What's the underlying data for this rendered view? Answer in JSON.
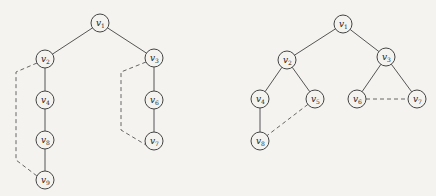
{
  "style": {
    "background": "#f4f3f0",
    "edge_color": "#555555",
    "node_radius": 9
  },
  "graphs": [
    {
      "name": "left-tree",
      "nodes": [
        {
          "id": "v1",
          "label": "v",
          "sub": "1",
          "x": 100,
          "y": 23
        },
        {
          "id": "v2",
          "label": "v",
          "sub": "2",
          "x": 45,
          "y": 59
        },
        {
          "id": "v3",
          "label": "v",
          "sub": "3",
          "x": 154,
          "y": 58
        },
        {
          "id": "v4",
          "label": "v",
          "sub": "4",
          "x": 45,
          "y": 100
        },
        {
          "id": "v6",
          "label": "v",
          "sub": "6",
          "x": 154,
          "y": 100
        },
        {
          "id": "v8",
          "label": "v",
          "sub": "8",
          "x": 45,
          "y": 140
        },
        {
          "id": "v7",
          "label": "v",
          "sub": "7",
          "x": 154,
          "y": 141
        },
        {
          "id": "v9",
          "label": "v",
          "sub": "9",
          "x": 45,
          "y": 180
        }
      ],
      "edges": [
        {
          "from": "v1",
          "to": "v2",
          "style": "solid"
        },
        {
          "from": "v1",
          "to": "v3",
          "style": "solid"
        },
        {
          "from": "v2",
          "to": "v4",
          "style": "solid"
        },
        {
          "from": "v4",
          "to": "v8",
          "style": "solid"
        },
        {
          "from": "v8",
          "to": "v9",
          "style": "solid"
        },
        {
          "from": "v3",
          "to": "v6",
          "style": "solid"
        },
        {
          "from": "v6",
          "to": "v7",
          "style": "solid"
        }
      ],
      "dashed_paths": [
        {
          "from": "v2",
          "to": "v9",
          "points": [
            [
              37,
              63
            ],
            [
              16,
              72
            ],
            [
              16,
              160
            ],
            [
              37,
              176
            ]
          ]
        },
        {
          "from": "v3",
          "to": "v7",
          "points": [
            [
              146,
              62
            ],
            [
              121,
              72
            ],
            [
              121,
              130
            ],
            [
              146,
              145
            ]
          ]
        }
      ]
    },
    {
      "name": "right-tree",
      "nodes": [
        {
          "id": "v1",
          "label": "v",
          "sub": "1",
          "x": 343,
          "y": 24
        },
        {
          "id": "v2",
          "label": "v",
          "sub": "2",
          "x": 287,
          "y": 60
        },
        {
          "id": "v3",
          "label": "v",
          "sub": "3",
          "x": 386,
          "y": 57
        },
        {
          "id": "v4",
          "label": "v",
          "sub": "4",
          "x": 260,
          "y": 99
        },
        {
          "id": "v5",
          "label": "v",
          "sub": "5",
          "x": 315,
          "y": 99
        },
        {
          "id": "v6",
          "label": "v",
          "sub": "6",
          "x": 357,
          "y": 99
        },
        {
          "id": "v7",
          "label": "v",
          "sub": "7",
          "x": 417,
          "y": 99
        },
        {
          "id": "v8",
          "label": "v",
          "sub": "8",
          "x": 260,
          "y": 141
        }
      ],
      "edges": [
        {
          "from": "v1",
          "to": "v2",
          "style": "solid"
        },
        {
          "from": "v1",
          "to": "v3",
          "style": "solid"
        },
        {
          "from": "v2",
          "to": "v4",
          "style": "solid"
        },
        {
          "from": "v2",
          "to": "v5",
          "style": "solid"
        },
        {
          "from": "v4",
          "to": "v8",
          "style": "solid"
        },
        {
          "from": "v3",
          "to": "v6",
          "style": "solid"
        },
        {
          "from": "v3",
          "to": "v7",
          "style": "solid"
        },
        {
          "from": "v5",
          "to": "v8",
          "style": "dashed"
        },
        {
          "from": "v6",
          "to": "v7",
          "style": "dashed"
        }
      ],
      "dashed_paths": []
    }
  ]
}
